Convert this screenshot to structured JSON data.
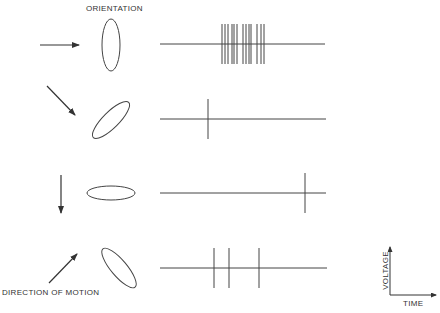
{
  "labels": {
    "orientation": "ORIENTATION",
    "direction_of_motion": "DIRECTION OF MOTION",
    "voltage": "VOLTAGE",
    "time": "TIME"
  },
  "colors": {
    "ink": "#444444",
    "background": "#ffffff"
  },
  "rows": [
    {
      "id": "row-1",
      "direction": "right",
      "arrow": {
        "x1": 40,
        "y1": 45,
        "x2": 79,
        "y2": 45
      },
      "ellipse": {
        "cx": 111,
        "cy": 45,
        "rx": 9,
        "ry": 26,
        "rotate": 0
      },
      "trace": {
        "x1": 160,
        "x2": 325,
        "y": 44,
        "spike_half_height": 20
      },
      "response": "strong burst",
      "spikes_x": [
        222,
        225,
        228,
        232,
        234,
        237,
        243,
        246,
        249,
        251,
        257,
        261,
        264
      ]
    },
    {
      "id": "row-2",
      "direction": "down-right",
      "arrow": {
        "x1": 47,
        "y1": 86,
        "x2": 75,
        "y2": 115
      },
      "ellipse": {
        "cx": 111,
        "cy": 120,
        "rx": 8,
        "ry": 25,
        "rotate": 45
      },
      "trace": {
        "x1": 160,
        "x2": 326,
        "y": 119,
        "spike_half_height": 20
      },
      "response": "single spike",
      "spikes_x": [
        208
      ]
    },
    {
      "id": "row-3",
      "direction": "down",
      "arrow": {
        "x1": 61,
        "y1": 175,
        "x2": 61,
        "y2": 213
      },
      "ellipse": {
        "cx": 111,
        "cy": 193,
        "rx": 24,
        "ry": 7,
        "rotate": 0
      },
      "trace": {
        "x1": 160,
        "x2": 326,
        "y": 193,
        "spike_half_height": 20
      },
      "response": "single late spike",
      "spikes_x": [
        305
      ]
    },
    {
      "id": "row-4",
      "direction": "up-right",
      "arrow": {
        "x1": 49,
        "y1": 283,
        "x2": 77,
        "y2": 254
      },
      "ellipse": {
        "cx": 119,
        "cy": 268,
        "rx": 8,
        "ry": 25,
        "rotate": -40
      },
      "trace": {
        "x1": 160,
        "x2": 327,
        "y": 268,
        "spike_half_height": 20
      },
      "response": "three spikes",
      "spikes_x": [
        214,
        229,
        259
      ]
    }
  ],
  "axes_key": {
    "origin": {
      "x": 390,
      "y": 295
    },
    "y_top": 247,
    "x_right": 436
  }
}
